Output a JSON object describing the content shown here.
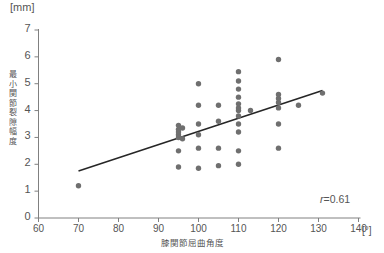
{
  "figure": {
    "unit_top": "[mm]",
    "unit_right": "[°]",
    "y_axis_title": "最小関節裂隙幅度",
    "x_axis_title": "膝関節屈曲角度",
    "correlation_prefix": "r",
    "correlation_equals": "=",
    "correlation_value": "0.61",
    "correlation_text": "r=0.61",
    "point_color": "#6f6f6f",
    "line_color": "#262626",
    "axis_color": "#808080"
  },
  "chart_data": {
    "type": "scatter",
    "title": "",
    "xlabel": "膝関節屈曲角度",
    "ylabel": "最小関節裂隙幅度",
    "xunit": "[°]",
    "yunit": "[mm]",
    "xlim": [
      60,
      140
    ],
    "ylim": [
      0,
      7
    ],
    "xticks": [
      60,
      70,
      80,
      90,
      100,
      110,
      120,
      130,
      140
    ],
    "xtick_labels": [
      "60",
      "70",
      "80",
      "90",
      "100",
      "110",
      "120",
      "130",
      "140"
    ],
    "yticks": [
      0,
      1,
      2,
      3,
      4,
      5,
      6,
      7
    ],
    "ytick_labels": [
      "0",
      "1",
      "2",
      "3",
      "4",
      "5",
      "6",
      "7"
    ],
    "grid": false,
    "legend": false,
    "annotations": [
      {
        "text": "r=0.61",
        "x": 130,
        "y": 0.9
      }
    ],
    "trendline": {
      "type": "linear",
      "x_start": 70,
      "y_start": 1.75,
      "x_end": 131,
      "y_end": 4.75,
      "slope": 0.0492,
      "intercept": -1.69
    },
    "points": [
      {
        "x": 70,
        "y": 1.2
      },
      {
        "x": 95,
        "y": 1.9
      },
      {
        "x": 95,
        "y": 2.5
      },
      {
        "x": 95,
        "y": 3.0
      },
      {
        "x": 95,
        "y": 3.1
      },
      {
        "x": 95,
        "y": 3.2
      },
      {
        "x": 95,
        "y": 3.3
      },
      {
        "x": 95,
        "y": 3.45
      },
      {
        "x": 96,
        "y": 2.95
      },
      {
        "x": 96,
        "y": 3.35
      },
      {
        "x": 100,
        "y": 1.85
      },
      {
        "x": 100,
        "y": 2.6
      },
      {
        "x": 100,
        "y": 3.1
      },
      {
        "x": 100,
        "y": 3.5
      },
      {
        "x": 100,
        "y": 4.2
      },
      {
        "x": 100,
        "y": 5.0
      },
      {
        "x": 105,
        "y": 1.95
      },
      {
        "x": 105,
        "y": 2.6
      },
      {
        "x": 105,
        "y": 3.6
      },
      {
        "x": 105,
        "y": 4.2
      },
      {
        "x": 110,
        "y": 2.0
      },
      {
        "x": 110,
        "y": 2.5
      },
      {
        "x": 110,
        "y": 3.2
      },
      {
        "x": 110,
        "y": 3.5
      },
      {
        "x": 110,
        "y": 3.8
      },
      {
        "x": 110,
        "y": 4.0
      },
      {
        "x": 110,
        "y": 4.1
      },
      {
        "x": 110,
        "y": 4.25
      },
      {
        "x": 110,
        "y": 4.5
      },
      {
        "x": 110,
        "y": 4.8
      },
      {
        "x": 110,
        "y": 5.1
      },
      {
        "x": 110,
        "y": 5.45
      },
      {
        "x": 113,
        "y": 4.0
      },
      {
        "x": 120,
        "y": 2.6
      },
      {
        "x": 120,
        "y": 3.5
      },
      {
        "x": 120,
        "y": 4.1
      },
      {
        "x": 120,
        "y": 4.3
      },
      {
        "x": 120,
        "y": 4.45
      },
      {
        "x": 120,
        "y": 4.6
      },
      {
        "x": 120,
        "y": 5.9
      },
      {
        "x": 125,
        "y": 4.2
      },
      {
        "x": 131,
        "y": 4.65
      }
    ]
  }
}
